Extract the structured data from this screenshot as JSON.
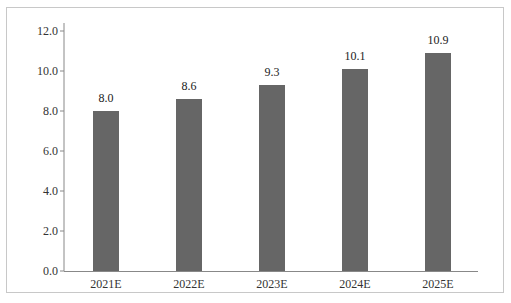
{
  "chart_data": {
    "type": "bar",
    "title": "",
    "xlabel": "",
    "ylabel": "",
    "categories": [
      "2021E",
      "2022E",
      "2023E",
      "2024E",
      "2025E"
    ],
    "values": [
      8.0,
      8.6,
      9.3,
      10.1,
      10.9
    ],
    "value_labels": [
      "8.0",
      "8.6",
      "9.3",
      "10.1",
      "10.9"
    ],
    "ylim": [
      0,
      12
    ],
    "yticks": [
      "0.0",
      "2.0",
      "4.0",
      "6.0",
      "8.0",
      "10.0",
      "12.0"
    ],
    "grid": false,
    "legend": "none",
    "bar_color": "#666666"
  }
}
